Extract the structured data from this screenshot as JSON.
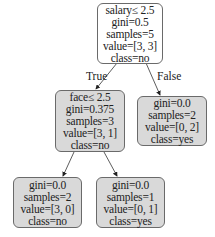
{
  "tree": {
    "root": {
      "lines": [
        "salary≤ 2.5",
        "gini=0.5",
        "samples=5",
        "value=[3, 3]",
        "class=no"
      ],
      "fill": "#ffffff"
    },
    "left": {
      "lines": [
        "face≤ 2.5",
        "gini=0.375",
        "samples=3",
        "value=[3, 1]",
        "class=no"
      ],
      "fill": "#d9d9d9"
    },
    "right": {
      "lines": [
        "gini=0.0",
        "samples=2",
        "value=[0, 2]",
        "class=yes"
      ],
      "fill": "#d9d9d9"
    },
    "left_left": {
      "lines": [
        "gini=0.0",
        "samples=2",
        "value=[3, 0]",
        "class=no"
      ],
      "fill": "#d9d9d9"
    },
    "left_right": {
      "lines": [
        "gini=0.0",
        "samples=1",
        "value=[0, 1]",
        "class=yes"
      ],
      "fill": "#d9d9d9"
    }
  },
  "edges": {
    "true_label": "True",
    "false_label": "False"
  }
}
